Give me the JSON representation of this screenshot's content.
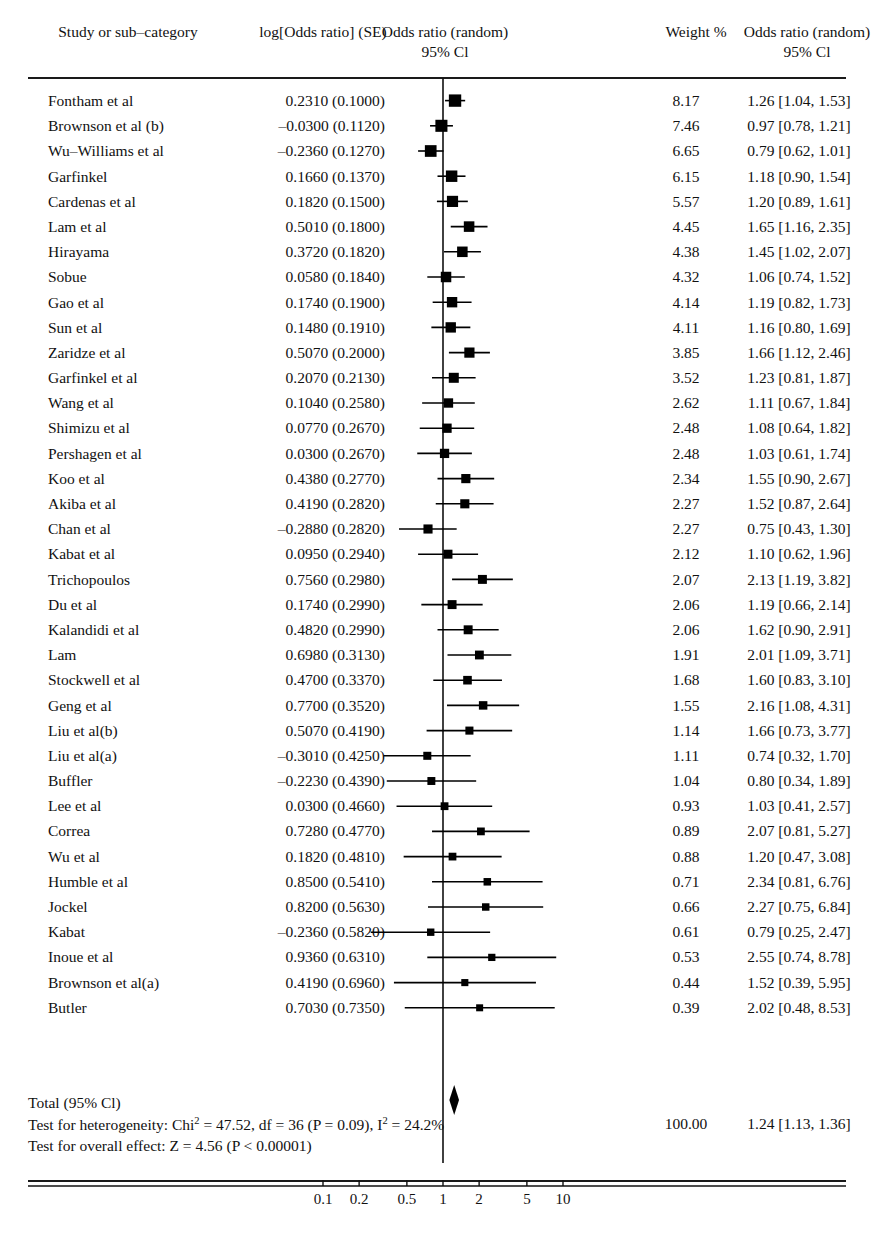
{
  "header": {
    "col_study": "Study or sub–category",
    "col_logor": "log[Odds ratio] (SE)",
    "col_plot_line1": "Odds ratio (random)",
    "col_plot_line2": "95% Cl",
    "col_weight": "Weight %",
    "col_or_line1": "Odds ratio (random)",
    "col_or_line2": "95% Cl"
  },
  "totals": {
    "total_label": "Total (95% Cl)",
    "heterogeneity_pre": "Test for heterogeneity: Chi",
    "heterogeneity_sup1": "2",
    "heterogeneity_mid": " = 47.52, df = 36 (P = 0.09), I",
    "heterogeneity_sup2": "2",
    "heterogeneity_post": " = 24.2%",
    "overall_effect": "Test for overall effect: Z = 4.56 (P < 0.00001)",
    "total_weight": "100.00",
    "total_or": "1.24 [1.13, 1.36]",
    "diamond_center": 1.24,
    "diamond_low": 1.13,
    "diamond_high": 1.36
  },
  "axis": {
    "ticks": [
      "0.1",
      "0.2",
      "0.5",
      "1",
      "2",
      "5",
      "10"
    ],
    "tick_values": [
      0.1,
      0.2,
      0.5,
      1,
      2,
      5,
      10
    ],
    "null_value": 1
  },
  "colors": {
    "ink": "#111111",
    "marker": "#000000",
    "rule": "#1a1a1a"
  },
  "chart_data": {
    "type": "forest",
    "title": "Odds ratio (random) 95% Cl",
    "xlabel": "Odds ratio (random) 95% Cl",
    "ylabel": "Study or sub–category",
    "scale": "log",
    "xlim": [
      0.08,
      13
    ],
    "null_line": 1,
    "grid": false,
    "legend": "none",
    "columns": [
      "Study or sub-category",
      "log[Odds ratio] (SE)",
      "Odds ratio (random) 95% Cl",
      "Weight %",
      "Odds ratio (random) 95% Cl"
    ],
    "studies": [
      {
        "study": "Fontham et al",
        "logor": "0.2310 (0.1000)",
        "log_val": 0.231,
        "se": 0.1,
        "weight": "8.17",
        "weight_val": 8.17,
        "or": "1.26 [1.04, 1.53]",
        "est": 1.26,
        "low": 1.04,
        "high": 1.53
      },
      {
        "study": "Brownson et al (b)",
        "logor": "–0.0300 (0.1120)",
        "log_val": -0.03,
        "se": 0.112,
        "weight": "7.46",
        "weight_val": 7.46,
        "or": "0.97 [0.78, 1.21]",
        "est": 0.97,
        "low": 0.78,
        "high": 1.21
      },
      {
        "study": "Wu–Williams et al",
        "logor": "–0.2360 (0.1270)",
        "log_val": -0.236,
        "se": 0.127,
        "weight": "6.65",
        "weight_val": 6.65,
        "or": "0.79 [0.62, 1.01]",
        "est": 0.79,
        "low": 0.62,
        "high": 1.01
      },
      {
        "study": "Garfinkel",
        "logor": "0.1660 (0.1370)",
        "log_val": 0.166,
        "se": 0.137,
        "weight": "6.15",
        "weight_val": 6.15,
        "or": "1.18 [0.90, 1.54]",
        "est": 1.18,
        "low": 0.9,
        "high": 1.54
      },
      {
        "study": "Cardenas et al",
        "logor": "0.1820 (0.1500)",
        "log_val": 0.182,
        "se": 0.15,
        "weight": "5.57",
        "weight_val": 5.57,
        "or": "1.20 [0.89, 1.61]",
        "est": 1.2,
        "low": 0.89,
        "high": 1.61
      },
      {
        "study": "Lam et al",
        "logor": "0.5010 (0.1800)",
        "log_val": 0.501,
        "se": 0.18,
        "weight": "4.45",
        "weight_val": 4.45,
        "or": "1.65 [1.16, 2.35]",
        "est": 1.65,
        "low": 1.16,
        "high": 2.35
      },
      {
        "study": "Hirayama",
        "logor": "0.3720 (0.1820)",
        "log_val": 0.372,
        "se": 0.182,
        "weight": "4.38",
        "weight_val": 4.38,
        "or": "1.45 [1.02, 2.07]",
        "est": 1.45,
        "low": 1.02,
        "high": 2.07
      },
      {
        "study": "Sobue",
        "logor": "0.0580 (0.1840)",
        "log_val": 0.058,
        "se": 0.184,
        "weight": "4.32",
        "weight_val": 4.32,
        "or": "1.06 [0.74, 1.52]",
        "est": 1.06,
        "low": 0.74,
        "high": 1.52
      },
      {
        "study": "Gao et al",
        "logor": "0.1740 (0.1900)",
        "log_val": 0.174,
        "se": 0.19,
        "weight": "4.14",
        "weight_val": 4.14,
        "or": "1.19 [0.82, 1.73]",
        "est": 1.19,
        "low": 0.82,
        "high": 1.73
      },
      {
        "study": "Sun et al",
        "logor": "0.1480 (0.1910)",
        "log_val": 0.148,
        "se": 0.191,
        "weight": "4.11",
        "weight_val": 4.11,
        "or": "1.16 [0.80, 1.69]",
        "est": 1.16,
        "low": 0.8,
        "high": 1.69
      },
      {
        "study": "Zaridze et al",
        "logor": "0.5070 (0.2000)",
        "log_val": 0.507,
        "se": 0.2,
        "weight": "3.85",
        "weight_val": 3.85,
        "or": "1.66 [1.12, 2.46]",
        "est": 1.66,
        "low": 1.12,
        "high": 2.46
      },
      {
        "study": "Garfinkel et al",
        "logor": "0.2070 (0.2130)",
        "log_val": 0.207,
        "se": 0.213,
        "weight": "3.52",
        "weight_val": 3.52,
        "or": "1.23 [0.81, 1.87]",
        "est": 1.23,
        "low": 0.81,
        "high": 1.87
      },
      {
        "study": "Wang et al",
        "logor": "0.1040 (0.2580)",
        "log_val": 0.104,
        "se": 0.258,
        "weight": "2.62",
        "weight_val": 2.62,
        "or": "1.11  [0.67, 1.84]",
        "est": 1.11,
        "low": 0.67,
        "high": 1.84
      },
      {
        "study": "Shimizu et al",
        "logor": "0.0770 (0.2670)",
        "log_val": 0.077,
        "se": 0.267,
        "weight": "2.48",
        "weight_val": 2.48,
        "or": "1.08 [0.64, 1.82]",
        "est": 1.08,
        "low": 0.64,
        "high": 1.82
      },
      {
        "study": "Pershagen et al",
        "logor": "0.0300 (0.2670)",
        "log_val": 0.03,
        "se": 0.267,
        "weight": "2.48",
        "weight_val": 2.48,
        "or": "1.03 [0.61, 1.74]",
        "est": 1.03,
        "low": 0.61,
        "high": 1.74
      },
      {
        "study": "Koo et al",
        "logor": "0.4380 (0.2770)",
        "log_val": 0.438,
        "se": 0.277,
        "weight": "2.34",
        "weight_val": 2.34,
        "or": "1.55 [0.90, 2.67]",
        "est": 1.55,
        "low": 0.9,
        "high": 2.67
      },
      {
        "study": "Akiba et al",
        "logor": "0.4190 (0.2820)",
        "log_val": 0.419,
        "se": 0.282,
        "weight": "2.27",
        "weight_val": 2.27,
        "or": "1.52 [0.87, 2.64]",
        "est": 1.52,
        "low": 0.87,
        "high": 2.64
      },
      {
        "study": "Chan et al",
        "logor": "–0.2880 (0.2820)",
        "log_val": -0.288,
        "se": 0.282,
        "weight": "2.27",
        "weight_val": 2.27,
        "or": "0.75  [0.43, 1.30]",
        "est": 0.75,
        "low": 0.43,
        "high": 1.3
      },
      {
        "study": "Kabat et al",
        "logor": "0.0950 (0.2940)",
        "log_val": 0.095,
        "se": 0.294,
        "weight": "2.12",
        "weight_val": 2.12,
        "or": "1.10  [0.62, 1.96]",
        "est": 1.1,
        "low": 0.62,
        "high": 1.96
      },
      {
        "study": "Trichopoulos",
        "logor": "0.7560  (0.2980)",
        "log_val": 0.756,
        "se": 0.298,
        "weight": "2.07",
        "weight_val": 2.07,
        "or": "2.13 [1.19, 3.82]",
        "est": 2.13,
        "low": 1.19,
        "high": 3.82
      },
      {
        "study": "Du et al",
        "logor": "0.1740 (0.2990)",
        "log_val": 0.174,
        "se": 0.299,
        "weight": "2.06",
        "weight_val": 2.06,
        "or": "1.19  [0.66, 2.14]",
        "est": 1.19,
        "low": 0.66,
        "high": 2.14
      },
      {
        "study": "Kalandidi et al",
        "logor": "0.4820 (0.2990)",
        "log_val": 0.482,
        "se": 0.299,
        "weight": "2.06",
        "weight_val": 2.06,
        "or": "1.62 [0.90, 2.91]",
        "est": 1.62,
        "low": 0.9,
        "high": 2.91
      },
      {
        "study": "Lam",
        "logor": "0.6980 (0.3130)",
        "log_val": 0.698,
        "se": 0.313,
        "weight": "1.91",
        "weight_val": 1.91,
        "or": "2.01 [1.09, 3.71]",
        "est": 2.01,
        "low": 1.09,
        "high": 3.71
      },
      {
        "study": "Stockwell et al",
        "logor": "0.4700  (0.3370)",
        "log_val": 0.47,
        "se": 0.337,
        "weight": "1.68",
        "weight_val": 1.68,
        "or": "1.60 [0.83, 3.10]",
        "est": 1.6,
        "low": 0.83,
        "high": 3.1
      },
      {
        "study": "Geng et al",
        "logor": "0.7700 (0.3520)",
        "log_val": 0.77,
        "se": 0.352,
        "weight": "1.55",
        "weight_val": 1.55,
        "or": "2.16 [1.08, 4.31]",
        "est": 2.16,
        "low": 1.08,
        "high": 4.31
      },
      {
        "study": "Liu et al(b)",
        "logor": "0.5070 (0.4190)",
        "log_val": 0.507,
        "se": 0.419,
        "weight": "1.14",
        "weight_val": 1.14,
        "or": "1.66 [0.73, 3.77]",
        "est": 1.66,
        "low": 0.73,
        "high": 3.77
      },
      {
        "study": "Liu et al(a)",
        "logor": "–0.3010 (0.4250)",
        "log_val": -0.301,
        "se": 0.425,
        "weight": "1.11",
        "weight_val": 1.11,
        "or": "0.74 [0.32, 1.70]",
        "est": 0.74,
        "low": 0.32,
        "high": 1.7
      },
      {
        "study": "Buffler",
        "logor": "–0.2230 (0.4390)",
        "log_val": -0.223,
        "se": 0.439,
        "weight": "1.04",
        "weight_val": 1.04,
        "or": "0.80 [0.34, 1.89]",
        "est": 0.8,
        "low": 0.34,
        "high": 1.89
      },
      {
        "study": "Lee et al",
        "logor": "0.0300 (0.4660)",
        "log_val": 0.03,
        "se": 0.466,
        "weight": "0.93",
        "weight_val": 0.93,
        "or": "1.03 [0.41, 2.57]",
        "est": 1.03,
        "low": 0.41,
        "high": 2.57
      },
      {
        "study": "Correa",
        "logor": "0.7280 (0.4770)",
        "log_val": 0.728,
        "se": 0.477,
        "weight": "0.89",
        "weight_val": 0.89,
        "or": "2.07 [0.81, 5.27]",
        "est": 2.07,
        "low": 0.81,
        "high": 5.27
      },
      {
        "study": "Wu et al",
        "logor": "0.1820 (0.4810)",
        "log_val": 0.182,
        "se": 0.481,
        "weight": "0.88",
        "weight_val": 0.88,
        "or": "1.20 [0.47, 3.08]",
        "est": 1.2,
        "low": 0.47,
        "high": 3.08
      },
      {
        "study": "Humble et al",
        "logor": "0.8500 (0.5410)",
        "log_val": 0.85,
        "se": 0.541,
        "weight": "0.71",
        "weight_val": 0.71,
        "or": "2.34 [0.81, 6.76]",
        "est": 2.34,
        "low": 0.81,
        "high": 6.76
      },
      {
        "study": "Jockel",
        "logor": "0.8200 (0.5630)",
        "log_val": 0.82,
        "se": 0.563,
        "weight": "0.66",
        "weight_val": 0.66,
        "or": "2.27 [0.75, 6.84]",
        "est": 2.27,
        "low": 0.75,
        "high": 6.84
      },
      {
        "study": "Kabat",
        "logor": "–0.2360 (0.5820)",
        "log_val": -0.236,
        "se": 0.582,
        "weight": "0.61",
        "weight_val": 0.61,
        "or": "0.79 [0.25, 2.47]",
        "est": 0.79,
        "low": 0.25,
        "high": 2.47
      },
      {
        "study": "Inoue et al",
        "logor": "0.9360  (0.6310)",
        "log_val": 0.936,
        "se": 0.631,
        "weight": "0.53",
        "weight_val": 0.53,
        "or": "2.55 [0.74, 8.78]",
        "est": 2.55,
        "low": 0.74,
        "high": 8.78
      },
      {
        "study": "Brownson et al(a)",
        "logor": "0.4190 (0.6960)",
        "log_val": 0.419,
        "se": 0.696,
        "weight": "0.44",
        "weight_val": 0.44,
        "or": "1.52 [0.39, 5.95]",
        "est": 1.52,
        "low": 0.39,
        "high": 5.95
      },
      {
        "study": "Butler",
        "logor": "0.7030 (0.7350)",
        "log_val": 0.703,
        "se": 0.735,
        "weight": "0.39",
        "weight_val": 0.39,
        "or": "2.02 [0.48, 8.53]",
        "est": 2.02,
        "low": 0.48,
        "high": 8.53
      }
    ]
  }
}
